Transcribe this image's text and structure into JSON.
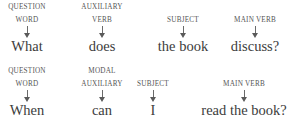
{
  "rows": [
    {
      "columns": [
        {
          "label_top": "QUESTION",
          "label_bottom": "WORD",
          "word": "What",
          "cx": 27
        },
        {
          "label_top": "AUXILIARY",
          "label_bottom": "VERB",
          "word": "does",
          "cx": 102
        },
        {
          "label_top": "",
          "label_bottom": "SUBJECT",
          "word": "the book",
          "cx": 183
        },
        {
          "label_top": "",
          "label_bottom": "MAIN VERB",
          "word": "discuss?",
          "cx": 255
        }
      ]
    },
    {
      "columns": [
        {
          "label_top": "QUESTION",
          "label_bottom": "WORD",
          "word": "When",
          "cx": 27
        },
        {
          "label_top": "MODAL",
          "label_bottom": "AUXILIARY",
          "word": "can",
          "cx": 102
        },
        {
          "label_top": "",
          "label_bottom": "SUBJECT",
          "word": "I",
          "cx": 153
        },
        {
          "label_top": "",
          "label_bottom": "MAIN VERB",
          "word": "read the book?",
          "cx": 229
        }
      ]
    }
  ],
  "colors": {
    "text": "#3c3c3c",
    "label": "#555555",
    "arrow": "#5a5a5a",
    "background": "#ffffff"
  }
}
